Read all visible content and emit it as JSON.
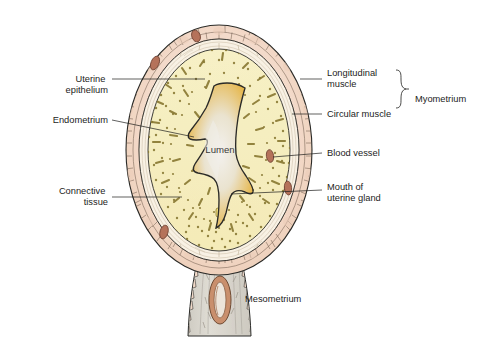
{
  "figure": {
    "center_label": "Lumen"
  },
  "labels_left": [
    {
      "id": "uterine-epithelium",
      "text_lines": [
        "Uterine",
        "epithelium"
      ],
      "x": 108,
      "y": 82,
      "line_height": 11
    },
    {
      "id": "endometrium",
      "text_lines": [
        "Endometrium"
      ],
      "x": 108,
      "y": 123,
      "line_height": 11
    },
    {
      "id": "connective-tissue",
      "text_lines": [
        "Connective",
        "tissue"
      ],
      "x": 108,
      "y": 194,
      "line_height": 11
    }
  ],
  "labels_right": [
    {
      "id": "longitudinal-muscle",
      "text_lines": [
        "Longitudinal",
        "muscle"
      ],
      "x": 327,
      "y": 82,
      "line_height": 11
    },
    {
      "id": "circular-muscle",
      "text_lines": [
        "Circular muscle"
      ],
      "x": 327,
      "y": 117,
      "line_height": 11
    },
    {
      "id": "blood-vessel",
      "text_lines": [
        "Blood vessel"
      ],
      "x": 327,
      "y": 156,
      "line_height": 11
    },
    {
      "id": "mouth-of-uterine-gland",
      "text_lines": [
        "Mouth of",
        "uterine gland"
      ],
      "x": 327,
      "y": 193,
      "line_height": 11
    }
  ],
  "labels_bracket": {
    "id": "myometrium",
    "text": "Myometrium",
    "x": 415,
    "y": 102
  },
  "labels_bottom": [
    {
      "id": "mesometrium",
      "text": "Mesometrium",
      "x": 245,
      "y": 302
    }
  ],
  "colors": {
    "outline": "#2b2b28",
    "serosa_pink": "#f2d9c8",
    "serosa_pink_dark": "#e6c3ae",
    "circular_muscle": "#f7efe2",
    "endometrium": "#f6eec0",
    "endometrium_edge": "#efe3a8",
    "lumen_gold": "#e8b63c",
    "lumen_pale": "#ece9e4",
    "blood_vessel": "#b5725a",
    "gland_stipple": "#8a7a35",
    "mesometrium_body": "#d8d5cd",
    "mesometrium_vessel": "#c98f6d",
    "text": "#1d1d1b"
  },
  "structures": [
    {
      "id": "serosa-longitudinal-muscle-layer",
      "name": "Longitudinal muscle / serosa"
    },
    {
      "id": "circular-muscle-layer",
      "name": "Circular muscle"
    },
    {
      "id": "endometrium-layer",
      "name": "Endometrium"
    },
    {
      "id": "lumen-cavity",
      "name": "Lumen"
    },
    {
      "id": "mesometrium-stalk",
      "name": "Mesometrium"
    }
  ],
  "blood_vessels": [
    {
      "id": "bv-top",
      "cx": 196,
      "cy": 36,
      "rx": 4.2,
      "ry": 6.0,
      "rot": -20
    },
    {
      "id": "bv-upper-left",
      "cx": 155,
      "cy": 63,
      "rx": 4.0,
      "ry": 7.2,
      "rot": 22
    },
    {
      "id": "bv-right-upper",
      "cx": 270,
      "cy": 156,
      "rx": 3.6,
      "ry": 6.4,
      "rot": -8
    },
    {
      "id": "bv-right-lower",
      "cx": 288,
      "cy": 188,
      "rx": 3.6,
      "ry": 7.0,
      "rot": -6
    },
    {
      "id": "bv-lower-left",
      "cx": 164,
      "cy": 232,
      "rx": 4.0,
      "ry": 7.0,
      "rot": 16
    }
  ]
}
